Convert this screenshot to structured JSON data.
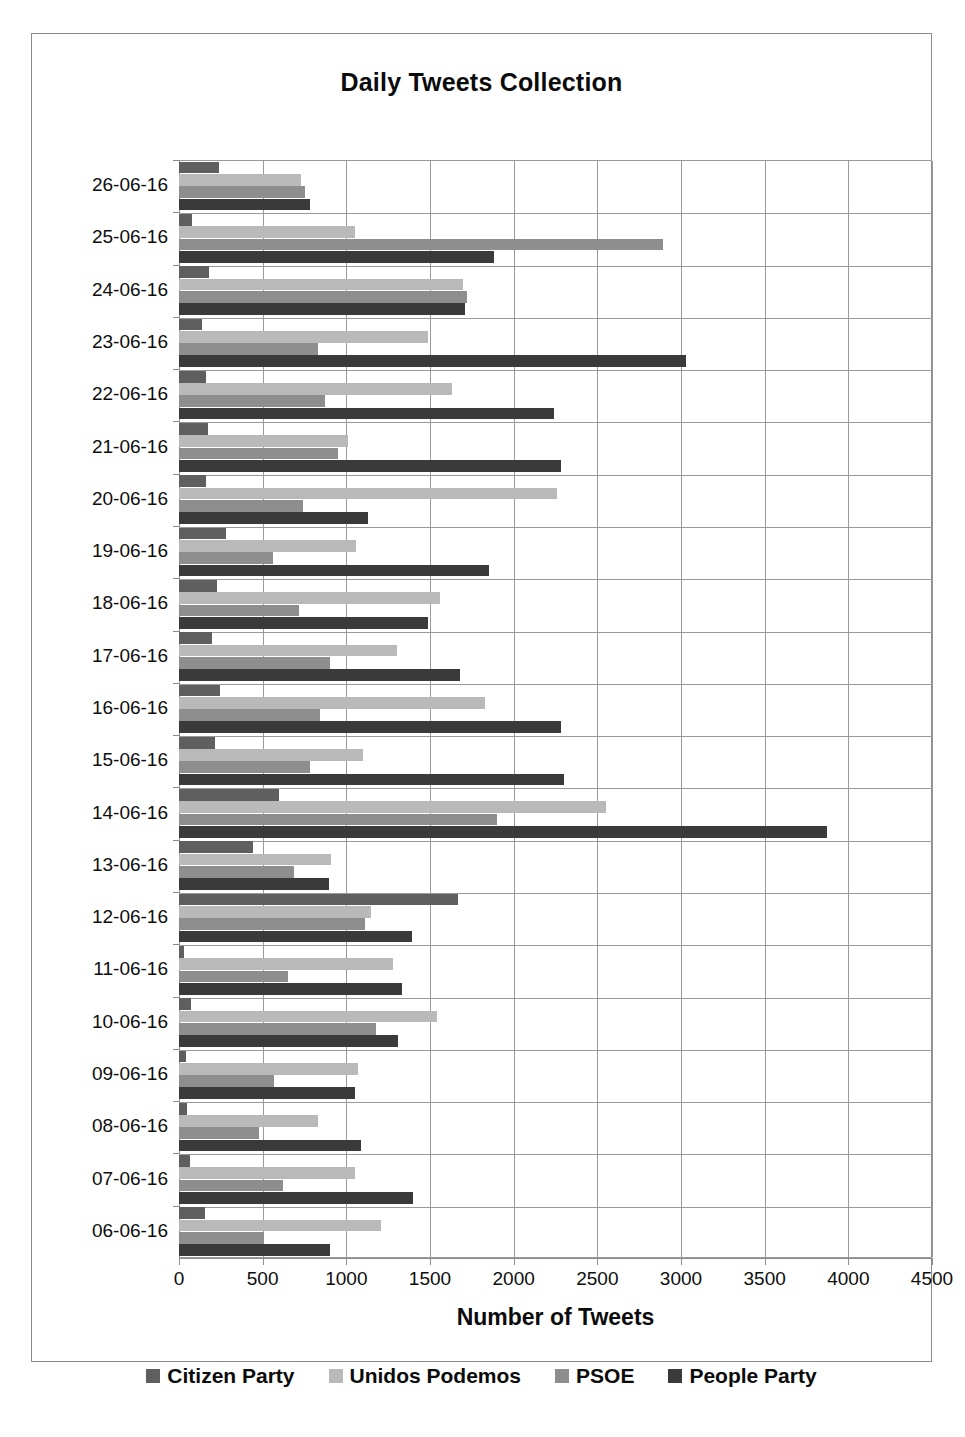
{
  "chart_data": {
    "type": "bar",
    "orientation": "horizontal",
    "title": "Daily Tweets Collection",
    "xlabel": "Number of Tweets",
    "ylabel": "",
    "xlim": [
      0,
      4500
    ],
    "xticks": [
      0,
      500,
      1000,
      1500,
      2000,
      2500,
      3000,
      3500,
      4000,
      4500
    ],
    "xtick_labels": [
      "0",
      "500",
      "1000",
      "1500",
      "2000",
      "2500",
      "3000",
      "3500",
      "4000",
      "4500"
    ],
    "grid": "vertical-and-horizontal",
    "legend_position": "bottom",
    "categories": [
      "26-06-16",
      "25-06-16",
      "24-06-16",
      "23-06-16",
      "22-06-16",
      "21-06-16",
      "20-06-16",
      "19-06-16",
      "18-06-16",
      "17-06-16",
      "16-06-16",
      "15-06-16",
      "14-06-16",
      "13-06-16",
      "12-06-16",
      "11-06-16",
      "10-06-16",
      "09-06-16",
      "08-06-16",
      "07-06-16",
      "06-06-16"
    ],
    "series": [
      {
        "name": "Citizen Party",
        "color": "#5f5f5f",
        "values": [
          240,
          80,
          180,
          140,
          160,
          175,
          160,
          280,
          230,
          200,
          245,
          215,
          600,
          440,
          1670,
          30,
          70,
          40,
          50,
          65,
          155
        ]
      },
      {
        "name": "Unidos Podemos",
        "color": "#b9b9b9",
        "values": [
          730,
          1050,
          1700,
          1490,
          1630,
          1010,
          2260,
          1060,
          1560,
          1300,
          1830,
          1100,
          2550,
          910,
          1150,
          1280,
          1540,
          1070,
          830,
          1050,
          1210
        ]
      },
      {
        "name": "PSOE",
        "color": "#8e8e8e",
        "values": [
          750,
          2890,
          1720,
          830,
          870,
          950,
          740,
          560,
          720,
          900,
          840,
          780,
          1900,
          690,
          1110,
          650,
          1180,
          570,
          480,
          620,
          505
        ]
      },
      {
        "name": "People Party",
        "color": "#3a3a3a",
        "values": [
          780,
          1880,
          1710,
          3030,
          2240,
          2280,
          1130,
          1850,
          1490,
          1680,
          2280,
          2300,
          3870,
          895,
          1390,
          1330,
          1310,
          1050,
          1090,
          1400,
          905
        ]
      }
    ]
  },
  "colors": {
    "frame_border": "#8c8c8c",
    "gridline": "#9a9a9a",
    "text": "#0d0d0d",
    "background": "#ffffff"
  }
}
